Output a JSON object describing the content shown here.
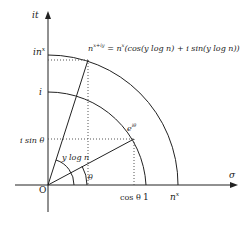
{
  "diagram": {
    "type": "complex-plane",
    "axes": {
      "horizontal_label": "σ",
      "vertical_label": "it",
      "origin_label": "O"
    },
    "tick_labels": {
      "horizontal": [
        "cos θ",
        "1",
        "n^x"
      ],
      "vertical": [
        "i sin θ",
        "i",
        "in^x"
      ]
    },
    "formula": "n^{x+iy} = n^x(cos(y log n) + i sin(y log n))",
    "formula_parts": {
      "lhs_base": "n",
      "lhs_exp": "x+iy",
      "eq": " = ",
      "rhs_base": "n",
      "rhs_exp": "x",
      "rhs_rest": "(cos(y log n) + i sin(y log n))"
    },
    "point_label": {
      "base": "e",
      "exp": "iθ"
    },
    "angle_labels": {
      "theta": "θ",
      "ylogn": "y log n"
    },
    "labels_text": {
      "sigma": "σ",
      "it": "it",
      "O": "O",
      "cos_theta": "cos θ",
      "one": "1",
      "nx_base": "n",
      "nx_exp": "x",
      "i_sin_theta": "i sin θ",
      "i": "i",
      "inx_base": "in",
      "inx_exp": "x"
    },
    "colors": {
      "line": "#222222",
      "dotted": "#555555"
    }
  }
}
